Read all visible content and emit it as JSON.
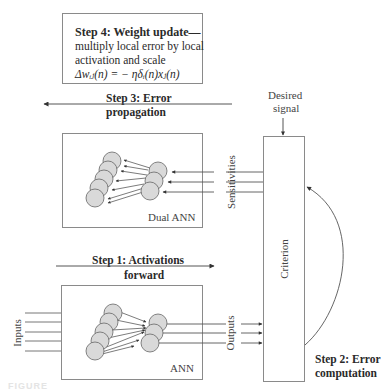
{
  "step4": {
    "title": "Step 4: Weight update—",
    "line1": "multiply local error by local",
    "line2": "activation and scale",
    "formula": "Δwᵢⱼ(n) = − ηδᵢ(n)xⱼ(n)"
  },
  "step3": {
    "line1": "Step 3: Error",
    "line2": "propagation"
  },
  "desired_signal": {
    "line1": "Desired",
    "line2": "signal"
  },
  "dual_ann": {
    "label": "Dual ANN",
    "sensitivities_label": "Sensitivities"
  },
  "step1": {
    "line1": "Step 1: Activations",
    "line2": "forward"
  },
  "ann": {
    "label": "ANN",
    "inputs_label": "Inputs",
    "outputs_label": "Outputs"
  },
  "criterion": {
    "label": "Criterion"
  },
  "step2": {
    "line1": "Step 2: Error",
    "line2": "computation"
  },
  "colors": {
    "node_fill": "#d9d9d9",
    "node_stroke": "#666666",
    "line": "#555555",
    "box_border": "#8a8a8a"
  }
}
